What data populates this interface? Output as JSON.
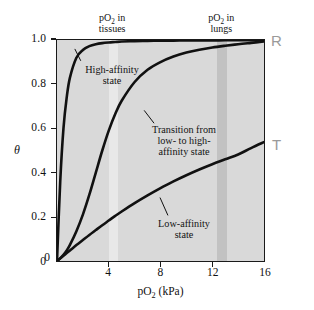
{
  "figure": {
    "name": "oxygen-binding-curves",
    "background_color": "#ffffff",
    "plot_background_color": "#d9d9d9",
    "curve_color": "#111111",
    "marker_color": "#9a9a9a"
  },
  "axes": {
    "x": {
      "label": "pO₂ (kPa)",
      "label_plain": "pO2 (kPa)",
      "min": 0,
      "max": 16,
      "ticks": [
        4,
        8,
        12,
        16
      ],
      "tick_labels": [
        "4",
        "8",
        "12",
        "16"
      ],
      "origin_label": "0"
    },
    "y": {
      "label": "θ",
      "label_plain": "theta",
      "min": 0,
      "max": 1.0,
      "ticks": [
        0,
        0.2,
        0.4,
        0.6,
        0.8,
        1.0
      ],
      "tick_labels": [
        "0",
        "0.2",
        "0.4",
        "0.6",
        "0.8",
        "1.0"
      ]
    }
  },
  "bands": [
    {
      "name": "tissues",
      "caption_line1": "pO₂ in",
      "caption_line2": "tissues",
      "x_start": 3.95,
      "x_end": 4.65,
      "color": "#e8e8e8"
    },
    {
      "name": "lungs",
      "caption_line1": "pO₂ in",
      "caption_line2": "lungs",
      "x_start": 12.25,
      "x_end": 13.05,
      "color": "#c2c2c2"
    }
  ],
  "state_markers": [
    {
      "name": "r-state",
      "label": "R"
    },
    {
      "name": "t-state",
      "label": "T"
    }
  ],
  "annotations": [
    {
      "name": "high-affinity-annotation",
      "lines": [
        "High-affinity",
        "state"
      ]
    },
    {
      "name": "transition-annotation",
      "lines": [
        "Transition from",
        "low- to high-",
        "affinity state"
      ]
    },
    {
      "name": "low-affinity-annotation",
      "lines": [
        "Low-affinity",
        "state"
      ]
    }
  ],
  "chart_data": {
    "type": "line",
    "title": "",
    "xlabel": "pO2 (kPa)",
    "ylabel": "theta",
    "xlim": [
      0,
      16
    ],
    "ylim": [
      0,
      1.0
    ],
    "grid": false,
    "legend": "annotations-inline",
    "x": [
      0,
      0.25,
      0.5,
      0.75,
      1,
      1.5,
      2,
      2.5,
      3,
      3.5,
      4,
      4.5,
      5,
      6,
      7,
      8,
      9,
      10,
      11,
      12,
      13,
      14,
      15,
      16
    ],
    "series": [
      {
        "name": "High-affinity state",
        "state": "R",
        "values": [
          0.0,
          0.36,
          0.6,
          0.74,
          0.83,
          0.92,
          0.955,
          0.972,
          0.981,
          0.986,
          0.989,
          0.991,
          0.993,
          0.995,
          0.996,
          0.997,
          0.997,
          0.998,
          0.998,
          0.998,
          0.999,
          0.999,
          0.999,
          1.0
        ]
      },
      {
        "name": "Transition from low- to high-affinity state",
        "state": "R<->T",
        "values": [
          0.0,
          0.012,
          0.028,
          0.048,
          0.073,
          0.135,
          0.21,
          0.3,
          0.4,
          0.5,
          0.59,
          0.665,
          0.725,
          0.81,
          0.865,
          0.9,
          0.925,
          0.943,
          0.956,
          0.966,
          0.974,
          0.981,
          0.987,
          0.993
        ]
      },
      {
        "name": "Low-affinity state",
        "state": "T",
        "values": [
          0.0,
          0.012,
          0.024,
          0.036,
          0.048,
          0.072,
          0.095,
          0.118,
          0.14,
          0.162,
          0.183,
          0.204,
          0.224,
          0.262,
          0.297,
          0.33,
          0.36,
          0.388,
          0.414,
          0.438,
          0.46,
          0.482,
          0.511,
          0.538
        ]
      }
    ],
    "shaded_regions": [
      {
        "label": "pO2 in tissues",
        "x_start": 3.95,
        "x_end": 4.65
      },
      {
        "label": "pO2 in lungs",
        "x_start": 12.25,
        "x_end": 13.05
      }
    ]
  }
}
